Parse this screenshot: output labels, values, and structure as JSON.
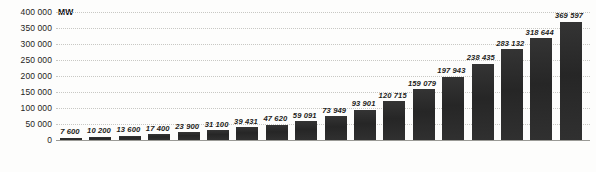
{
  "chart_data": {
    "type": "bar",
    "title": "",
    "subtitle": "",
    "xlabel": "",
    "ylabel": "MW",
    "unit_label": "MW",
    "grid": true,
    "legend": "none",
    "ylim": [
      0,
      400000
    ],
    "ytick_step": 50000,
    "ytick_labels": [
      "400 000",
      "350 000",
      "300 000",
      "250 000",
      "200 000",
      "150 000",
      "100 000",
      "50 000",
      "0"
    ],
    "ytick_values": [
      400000,
      350000,
      300000,
      250000,
      200000,
      150000,
      100000,
      50000,
      0
    ],
    "categories": [
      "1997",
      "1998",
      "1999",
      "2000",
      "2001",
      "2002",
      "2003",
      "2004",
      "2005",
      "2006",
      "2007",
      "2008",
      "2009",
      "2010",
      "2011",
      "2012",
      "2013",
      "2014"
    ],
    "values": [
      7600,
      10200,
      13600,
      17400,
      23900,
      31100,
      39431,
      47620,
      59091,
      73949,
      93901,
      120715,
      159079,
      197943,
      238435,
      283132,
      318644,
      369597
    ],
    "value_labels": [
      "7 600",
      "10 200",
      "13 600",
      "17 400",
      "23 900",
      "31 100",
      "39 431",
      "47 620",
      "59 091",
      "73 949",
      "93 901",
      "120 715",
      "159 079",
      "197 943",
      "238 435",
      "283 132",
      "318 644",
      "369 597"
    ],
    "bar_color": "#2b2b2b",
    "grid_color": "#c8c8c4",
    "text_color": "#1d1d1b",
    "background_color": "#fdfdfc"
  }
}
